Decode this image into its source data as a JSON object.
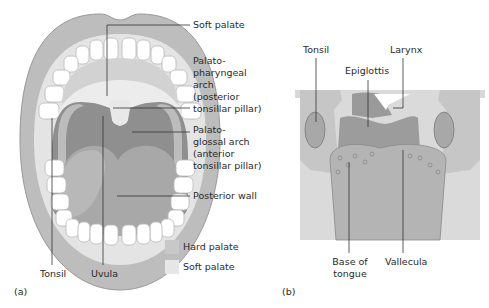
{
  "panel_a": {
    "caption": "(a)",
    "labels": {
      "soft_palate": "Soft palate",
      "palatopharyngeal": "Palato-\npharyngeal\narch\n(posterior\ntonsillar pillar)",
      "palatoglossal": "Palato-\nglossal arch\n(anterior\ntonsillar pillar)",
      "posterior_wall": "Posterior wall",
      "tonsil": "Tonsil",
      "uvula": "Uvula"
    },
    "legend": [
      {
        "label": "Hard palate",
        "color": "#c8c8c8"
      },
      {
        "label": "Soft palate",
        "color": "#e6e6e6"
      }
    ]
  },
  "panel_b": {
    "caption": "(b)",
    "labels": {
      "tonsil": "Tonsil",
      "larynx": "Larynx",
      "epiglottis": "Epiglottis",
      "base_of_tongue": "Base of\ntongue",
      "vallecula": "Vallecula"
    }
  },
  "colors": {
    "lip": "#bdbdbd",
    "gum": "#dcdcdc",
    "hard_palate": "#c8c8c8",
    "soft_palate": "#e6e6e6",
    "throat": "#8f8f8f",
    "tongue": "#a8a8a8",
    "teeth": "#ffffff",
    "leader": "#333333"
  }
}
